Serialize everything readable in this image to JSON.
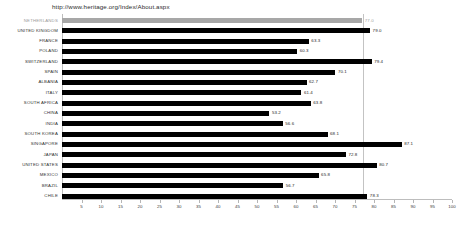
{
  "caption": {
    "url": "http://www.heritage.org/Index/About.aspx"
  },
  "colors": {
    "bar": "#000000",
    "bar_highlight": "#a7a7a7",
    "axis": "#bdbdbd",
    "reference_line": "#c3c3c3",
    "text": "#262626",
    "text_highlight": "#9a9a9a",
    "background": "#ffffff"
  },
  "chart_data": {
    "type": "bar",
    "orientation": "horizontal",
    "title": "",
    "xlabel": "",
    "ylabel": "",
    "xlim": [
      0,
      100
    ],
    "grid": false,
    "legend": "none",
    "reference_line_value": 77.0,
    "highlight_category": "NETHERLANDS",
    "xticks": [
      5,
      10,
      15,
      20,
      25,
      30,
      35,
      40,
      45,
      50,
      55,
      60,
      65,
      70,
      75,
      80,
      85,
      90,
      95,
      100
    ],
    "xticklabels": [
      "5",
      "10",
      "15",
      "20",
      "25",
      "30",
      "35",
      "40",
      "45",
      "50",
      "55",
      "60",
      "65",
      "70",
      "75",
      "80",
      "85",
      "90",
      "95",
      "100"
    ],
    "categories": [
      "NETHERLANDS",
      "UNITED KINGDOM",
      "FRANCE",
      "POLAND",
      "SWITZERLAND",
      "SPAIN",
      "ALBANIA",
      "ITALY",
      "SOUTH AFRICA",
      "CHINA",
      "INDIA",
      "SOUTH KOREA",
      "SINGAPORE",
      "JAPAN",
      "UNITED STATES",
      "MEXICO",
      "BRAZIL",
      "CHILE"
    ],
    "values": [
      77.0,
      79.0,
      63.3,
      60.3,
      79.4,
      70.1,
      62.7,
      61.4,
      63.8,
      53.2,
      56.6,
      68.1,
      87.1,
      72.8,
      80.7,
      65.8,
      56.7,
      78.3
    ],
    "value_labels": [
      "77.0",
      "79.0",
      "63.3",
      "60.3",
      "79.4",
      "70.1",
      "62.7",
      "61.4",
      "63.8",
      "53.2",
      "56.6",
      "68.1",
      "87.1",
      "72.8",
      "80.7",
      "65.8",
      "56.7",
      "78.3"
    ]
  }
}
